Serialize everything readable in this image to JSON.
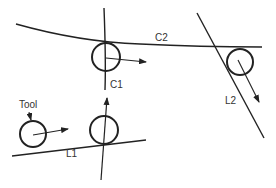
{
  "diagram": {
    "labels": {
      "tool": "Tool",
      "c1": "C1",
      "c2": "C2",
      "l1": "L1",
      "l2": "L2"
    },
    "colors": {
      "stroke": "#222222",
      "background": "#ffffff"
    },
    "elements": [
      {
        "id": "curve-c2",
        "type": "arc",
        "label": "C2"
      },
      {
        "id": "curve-c1",
        "type": "line-near-vertical",
        "label": "C1"
      },
      {
        "id": "line-l1",
        "type": "line",
        "label": "L1"
      },
      {
        "id": "line-l2",
        "type": "line",
        "label": "L2"
      },
      {
        "id": "tool-start",
        "type": "circle",
        "label": "Tool",
        "direction": "right"
      },
      {
        "id": "tool-at-l1-c1",
        "type": "circle",
        "direction": "up"
      },
      {
        "id": "tool-at-c1-c2",
        "type": "circle",
        "direction": "right"
      },
      {
        "id": "tool-at-c2-l2",
        "type": "circle",
        "direction": "down-right"
      }
    ]
  }
}
